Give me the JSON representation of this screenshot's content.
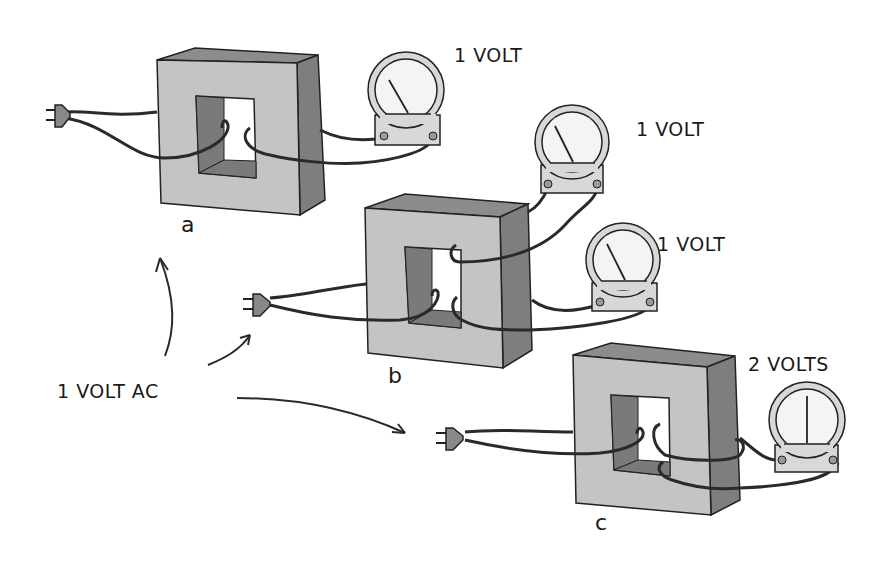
{
  "figure": {
    "source_label": "1 VOLT AC",
    "colors": {
      "core_front": "#c4c4c4",
      "core_side": "#7e7e7e",
      "core_top": "#8c8c8c",
      "window_inner": "#7a7a7a",
      "meter_face": "#f4f4f4",
      "meter_ring": "#d8d8d8",
      "wire": "#2a2a2a",
      "outline": "#222222"
    },
    "transformers": [
      {
        "id": "a",
        "label": "a",
        "meters": [
          {
            "reading": "1 VOLT",
            "needle_angle": -30
          }
        ]
      },
      {
        "id": "b",
        "label": "b",
        "meters": [
          {
            "reading": "1 VOLT",
            "needle_angle": -30
          },
          {
            "reading": "1 VOLT",
            "needle_angle": -30
          }
        ]
      },
      {
        "id": "c",
        "label": "c",
        "meters": [
          {
            "reading": "2 VOLTS",
            "needle_angle": 0
          }
        ]
      }
    ]
  }
}
